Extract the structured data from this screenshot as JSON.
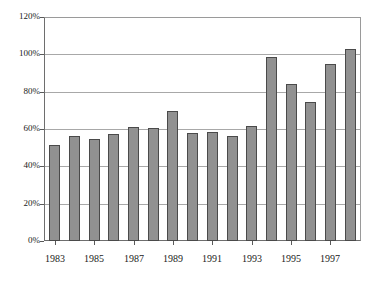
{
  "chart_data": {
    "type": "bar",
    "title": "",
    "subtitle": "",
    "xlabel": "",
    "ylabel": "",
    "categories": [
      "1983",
      "1984",
      "1985",
      "1986",
      "1987",
      "1988",
      "1989",
      "1990",
      "1991",
      "1992",
      "1993",
      "1994",
      "1995",
      "1996",
      "1997",
      "1998"
    ],
    "values": [
      51.5,
      56.5,
      54.5,
      57.5,
      61.0,
      60.5,
      69.5,
      58.0,
      58.3,
      56.0,
      61.7,
      98.8,
      84.3,
      74.5,
      94.8,
      103.0
    ],
    "value_unit": "%",
    "ylim": [
      0,
      120
    ],
    "ytick_values": [
      0,
      20,
      40,
      60,
      80,
      100,
      120
    ],
    "ytick_labels": [
      "0%",
      "20%",
      "40%",
      "60%",
      "80%",
      "100%",
      "120%"
    ],
    "xtick_labels": [
      "1983",
      "1985",
      "1987",
      "1989",
      "1991",
      "1993",
      "1995",
      "1997"
    ],
    "xtick_categories": [
      "1983",
      "1985",
      "1987",
      "1989",
      "1991",
      "1993",
      "1995",
      "1997"
    ],
    "grid": true,
    "grid_axis": "y",
    "legend": false,
    "legend_position": "none",
    "series": [
      {
        "name": "",
        "values": [
          51.5,
          56.5,
          54.5,
          57.5,
          61.0,
          60.5,
          69.5,
          58.0,
          58.3,
          56.0,
          61.7,
          98.8,
          84.3,
          74.5,
          94.8,
          103.0
        ]
      }
    ],
    "annotations": []
  },
  "style": {
    "bar_fill": "#919191",
    "bar_border": "#4a4a4a",
    "grid_color": "#a8a8a8",
    "axis_color": "#5a5a5a",
    "text_color": "#1a1a1a",
    "background": "#ffffff"
  }
}
